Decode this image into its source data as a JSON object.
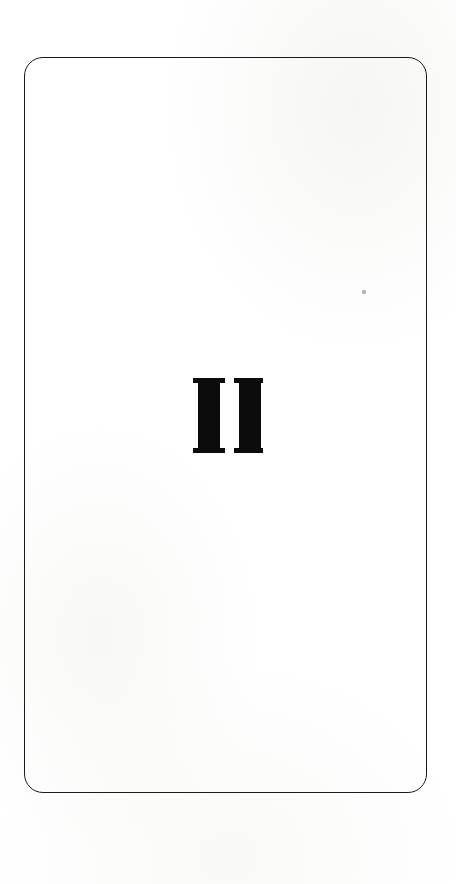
{
  "page": {
    "kind": "scanned-book-page",
    "role": "part-divider",
    "background_color": "#ffffff",
    "width": 456,
    "height": 884
  },
  "rule_box": {
    "name": "rounded-rectangle-rule",
    "stroke_color": "#1b1b1f",
    "stroke_width_px": 1.5,
    "corner_radius_px": 19,
    "left": 24,
    "top": 57,
    "width": 403,
    "height": 736,
    "fill": "none"
  },
  "part_number": {
    "text": "II",
    "meaning": "Roman numeral two",
    "style": "serif-slab",
    "color": "#0c0c0c",
    "bbox": {
      "left": 188,
      "top": 377,
      "width": 70,
      "height": 75
    },
    "stem_count": 2,
    "stem_width_px": 22,
    "stem_gap_px": 9,
    "serif_thickness_px": 5,
    "serif_overhang_px": 5
  },
  "artifacts": {
    "speck": {
      "name": "scan-speck",
      "color": "#78787c",
      "left": 362,
      "top": 290,
      "size_px": 4
    }
  }
}
